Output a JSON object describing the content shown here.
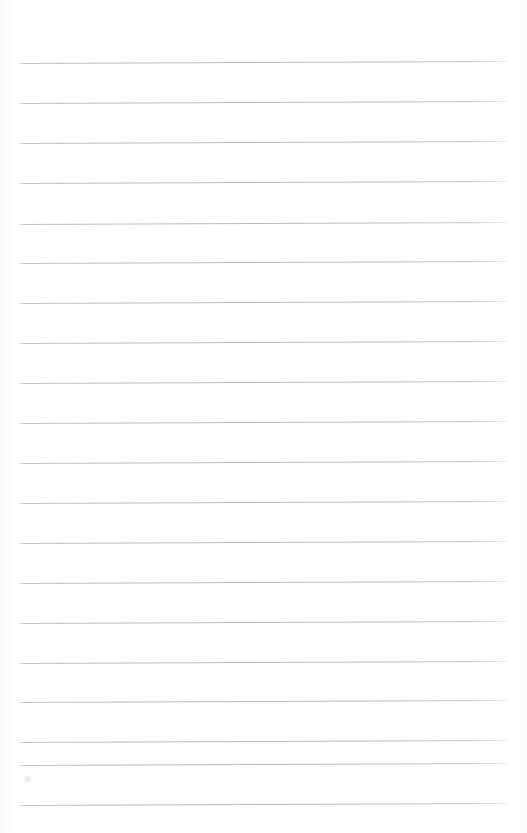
{
  "document": {
    "kind": "lined-paper-scan",
    "description": "Blank ruled notebook page",
    "content_text": "",
    "page_width": 527,
    "page_height": 833,
    "background_color": "#ffffff"
  },
  "rules": {
    "line_color": "#babac0",
    "line_thickness": 1,
    "line_spacing": 40,
    "line_left": 19,
    "line_right": 507,
    "line_count": 20,
    "first_line_y": 63,
    "last_line_y": 805,
    "skew_degrees": -0.24,
    "lines": [
      {
        "y": 63,
        "left": 19,
        "right": 507
      },
      {
        "y": 103,
        "left": 19,
        "right": 507
      },
      {
        "y": 143,
        "left": 19,
        "right": 507
      },
      {
        "y": 183,
        "left": 19,
        "right": 507
      },
      {
        "y": 224,
        "left": 19,
        "right": 507
      },
      {
        "y": 263,
        "left": 19,
        "right": 507
      },
      {
        "y": 303,
        "left": 19,
        "right": 507
      },
      {
        "y": 343,
        "left": 19,
        "right": 507
      },
      {
        "y": 383,
        "left": 19,
        "right": 507
      },
      {
        "y": 423,
        "left": 19,
        "right": 507
      },
      {
        "y": 463,
        "left": 19,
        "right": 507
      },
      {
        "y": 503,
        "left": 19,
        "right": 507
      },
      {
        "y": 543,
        "left": 19,
        "right": 507
      },
      {
        "y": 583,
        "left": 19,
        "right": 507
      },
      {
        "y": 623,
        "left": 19,
        "right": 507
      },
      {
        "y": 663,
        "left": 19,
        "right": 507
      },
      {
        "y": 702,
        "left": 19,
        "right": 507
      },
      {
        "y": 742,
        "left": 19,
        "right": 507
      },
      {
        "y": 765,
        "left": 19,
        "right": 507
      },
      {
        "y": 805,
        "left": 19,
        "right": 507
      }
    ]
  },
  "artifacts": {
    "smudge": {
      "x": 23,
      "y": 776,
      "width": 9,
      "height": 7
    }
  }
}
